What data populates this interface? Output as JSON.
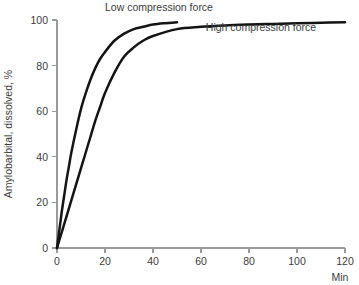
{
  "chart_data": {
    "type": "line",
    "title": "",
    "subtitle": "",
    "xlabel": "Min",
    "ylabel": "Amylobarbital, dissolved, %",
    "xlim": [
      0,
      120
    ],
    "ylim": [
      0,
      100
    ],
    "xticks": [
      0,
      20,
      40,
      60,
      80,
      100,
      120
    ],
    "xtick_labels": [
      "0",
      "20",
      "40",
      "60",
      "80",
      "100",
      "120"
    ],
    "yticks": [
      0,
      20,
      40,
      60,
      80,
      100
    ],
    "ytick_labels": [
      "0",
      "20",
      "40",
      "60",
      "80",
      "100"
    ],
    "grid": false,
    "legend_position": "inline-annotations",
    "line_color": "#141414",
    "axis_color": "#9a9a9a",
    "text_color": "#3b3b3b",
    "series": [
      {
        "name": "Low compression force",
        "label": "Low compression force",
        "label_x": 20,
        "label_y": 104,
        "x": [
          0,
          1,
          2,
          3,
          4,
          5,
          6,
          8,
          10,
          12,
          14,
          16,
          18,
          20,
          24,
          28,
          32,
          36,
          40,
          45,
          50
        ],
        "values": [
          0,
          8,
          16,
          23,
          30,
          36,
          42,
          52,
          61,
          68,
          74,
          79,
          83,
          86,
          91,
          94,
          96,
          97,
          98,
          98.6,
          99
        ]
      },
      {
        "name": "High compression force",
        "label": "High compression force",
        "label_x": 62,
        "label_y": 95,
        "x": [
          0,
          2,
          4,
          6,
          8,
          10,
          12,
          14,
          16,
          18,
          20,
          24,
          28,
          32,
          36,
          40,
          50,
          60,
          70,
          80,
          90,
          100,
          110,
          120
        ],
        "values": [
          0,
          7,
          14,
          21,
          28,
          35,
          42,
          49,
          56,
          62,
          68,
          77,
          84,
          88,
          91,
          93,
          96,
          97,
          97.6,
          98,
          98.3,
          98.6,
          98.8,
          99
        ]
      }
    ]
  }
}
